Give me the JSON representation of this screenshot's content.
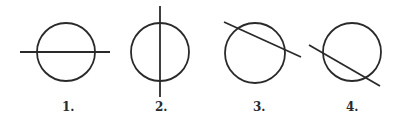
{
  "diagram": {
    "stroke_color": "#2a2a2a",
    "figures": [
      {
        "label": "1.",
        "circle": {
          "cx": 66,
          "cy": 52,
          "r": 29
        },
        "line": {
          "x1": 20,
          "y1": 52,
          "x2": 110,
          "y2": 52
        },
        "orientation": "horizontal"
      },
      {
        "label": "2.",
        "circle": {
          "cx": 160,
          "cy": 52,
          "r": 29
        },
        "line": {
          "x1": 160,
          "y1": 6,
          "x2": 160,
          "y2": 97
        },
        "orientation": "vertical"
      },
      {
        "label": "3.",
        "circle": {
          "cx": 255,
          "cy": 53,
          "r": 30
        },
        "line": {
          "x1": 224,
          "y1": 22,
          "x2": 301,
          "y2": 57
        },
        "orientation": "diagonal-shallow"
      },
      {
        "label": "4.",
        "circle": {
          "cx": 352,
          "cy": 52,
          "r": 29
        },
        "line": {
          "x1": 309,
          "y1": 45,
          "x2": 380,
          "y2": 86
        },
        "orientation": "diagonal-steep"
      }
    ]
  }
}
